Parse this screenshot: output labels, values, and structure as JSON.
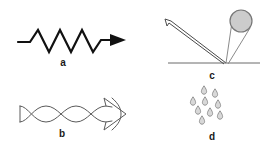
{
  "figure": {
    "title": "",
    "background_color": "#ffffff",
    "width": 268,
    "height": 152,
    "panel_count": 4
  },
  "panels": [
    {
      "id": "a",
      "label": "a",
      "name": "zigzag-arrow-panel",
      "description": "Zigzag (sawtooth wave) line with arrowhead pointing right",
      "stroke_color": "#111111",
      "stroke_width": 2.2,
      "fill_color": "none",
      "geometry": {
        "type": "zigzag-arrow",
        "lead_in": [
          [
            18,
            42
          ],
          [
            30,
            42
          ]
        ],
        "zigzag_points": [
          [
            30,
            42
          ],
          [
            38,
            30
          ],
          [
            49,
            52
          ],
          [
            60,
            30
          ],
          [
            71,
            52
          ],
          [
            82,
            30
          ],
          [
            93,
            52
          ],
          [
            101,
            40
          ]
        ],
        "tail": [
          [
            101,
            40
          ],
          [
            112,
            40
          ]
        ],
        "arrow_tip": [
          124,
          40
        ],
        "peaks": 4
      }
    },
    {
      "id": "b",
      "label": "b",
      "name": "twisted-ribbon-arrow-panel",
      "description": "Twisted ribbon arrow: two crossing sine curves forming three lobes, triangular tail at left and outlined arrowhead at right",
      "stroke_color": "#5a5a5a",
      "stroke_width": 1,
      "fill_color": "none",
      "geometry": {
        "type": "twisted-ribbon-arrow",
        "tail_x": 20,
        "head_x": 118,
        "axis_y": 38,
        "amplitude": 8,
        "crossings": 2,
        "lobes": 3
      }
    },
    {
      "id": "c",
      "label": "c",
      "name": "bouncing-ball-panel",
      "description": "Bouncing ball trajectory: thick incoming path from upper-left striking a horizontal ground line, thin outgoing path to upper-right terminating in a shaded ball",
      "stroke_color": "#4a4a4a",
      "ground_color": "#6a6a6a",
      "ball_fill": "#cccccc",
      "ball_stroke": "#777777",
      "geometry": {
        "type": "bounce-trajectory",
        "ground_line": [
          [
            34,
            63
          ],
          [
            126,
            63
          ]
        ],
        "impact_point": [
          92,
          63
        ],
        "incoming_path": [
          [
            92,
            63
          ],
          [
            36,
            22
          ]
        ],
        "incoming_width": 3,
        "outgoing_path": [
          [
            92,
            63
          ],
          [
            105,
            22
          ]
        ],
        "outgoing_width": 1,
        "ball_center": [
          107,
          21
        ],
        "ball_radius": 11
      }
    },
    {
      "id": "d",
      "label": "d",
      "name": "raindrops-panel",
      "description": "Scattered cluster of falling teardrop shapes (raindrops)",
      "stroke_color": "#8a8a8a",
      "fill_color": "#d8d8d8",
      "stroke_width": 0.9,
      "geometry": {
        "type": "droplet-cluster",
        "droplet_count": 9,
        "droplet_width": 5,
        "droplet_height": 8,
        "droplets": [
          [
            70,
            6
          ],
          [
            81,
            9
          ],
          [
            59,
            17
          ],
          [
            71,
            17
          ],
          [
            84,
            20
          ],
          [
            64,
            26
          ],
          [
            76,
            28
          ],
          [
            86,
            31
          ],
          [
            68,
            36
          ]
        ]
      }
    }
  ]
}
